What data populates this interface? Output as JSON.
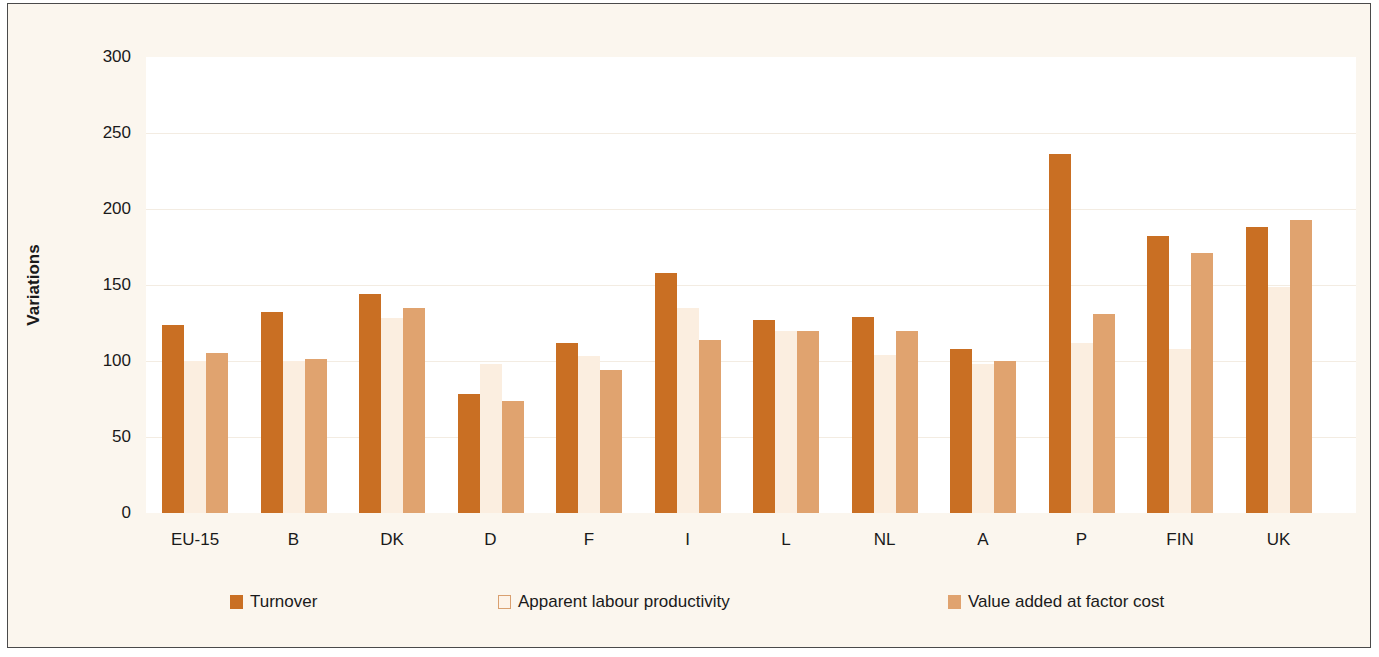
{
  "chart_data": {
    "type": "bar",
    "title": "",
    "xlabel": "",
    "ylabel": "Variations",
    "ylim": [
      0,
      300
    ],
    "yticks": [
      0,
      50,
      100,
      150,
      200,
      250,
      300
    ],
    "grid": true,
    "legend_position": "bottom",
    "categories": [
      "EU-15",
      "B",
      "DK",
      "D",
      "F",
      "I",
      "L",
      "NL",
      "A",
      "P",
      "FIN",
      "UK"
    ],
    "series": [
      {
        "name": "Turnover",
        "color": "#c96f23",
        "values": [
          124,
          132,
          144,
          78,
          112,
          158,
          127,
          129,
          108,
          236,
          182,
          188
        ]
      },
      {
        "name": "Apparent labour productivity",
        "color": "#fbeee0",
        "values": [
          100,
          100,
          128,
          98,
          103,
          135,
          120,
          104,
          98,
          112,
          108,
          149
        ]
      },
      {
        "name": "Value added at factor cost",
        "color": "#e0a36f",
        "values": [
          105,
          101,
          135,
          74,
          94,
          114,
          120,
          120,
          100,
          131,
          171,
          193
        ]
      }
    ]
  },
  "ylabel": "Variations",
  "yticks": [
    "0",
    "50",
    "100",
    "150",
    "200",
    "250",
    "300"
  ],
  "legend": [
    "Turnover",
    "Apparent labour productivity",
    "Value added at factor cost"
  ]
}
